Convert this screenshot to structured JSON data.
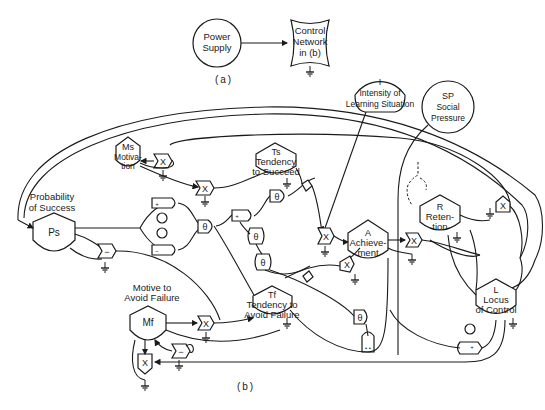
{
  "figure_a": {
    "caption": "(a)",
    "power_supply": {
      "lines": [
        "Power",
        "Supply"
      ]
    },
    "control_network": {
      "lines": [
        "Control",
        "Network",
        "in (b)"
      ]
    }
  },
  "figure_b": {
    "caption": "(b)",
    "nodes": {
      "motivation": {
        "symbol": "Ms",
        "lines": [
          "Motiva-",
          "tion"
        ]
      },
      "probability_of_success": {
        "symbol": "Ps",
        "title_lines": [
          "Probability",
          "of Success"
        ]
      },
      "tendency_to_succeed": {
        "symbol": "Ts",
        "lines": [
          "Tendency",
          "to Succeed"
        ]
      },
      "intensity": {
        "symbol": "I",
        "lines": [
          "Intensity of",
          "Learning Situation"
        ]
      },
      "social_pressure": {
        "symbol": "SP",
        "lines": [
          "Social",
          "Pressure"
        ]
      },
      "achievement": {
        "symbol": "A",
        "lines": [
          "Achieve-",
          "ment"
        ]
      },
      "retention": {
        "symbol": "R",
        "lines": [
          "Reten-",
          "tion"
        ]
      },
      "motive_to_avoid_failure": {
        "symbol": "Mf",
        "title_lines": [
          "Motive to",
          "Avoid Failure"
        ]
      },
      "tendency_to_avoid_failure": {
        "symbol": "Tf",
        "lines": [
          "Tendency to",
          "Avoid Failure"
        ]
      },
      "locus_of_control": {
        "symbol": "L",
        "lines": [
          "Locus",
          "of Control"
        ]
      }
    },
    "operators": {
      "multiply": "X",
      "subtract": "−",
      "threshold": "θ",
      "plus": "+",
      "minus": "−"
    }
  }
}
